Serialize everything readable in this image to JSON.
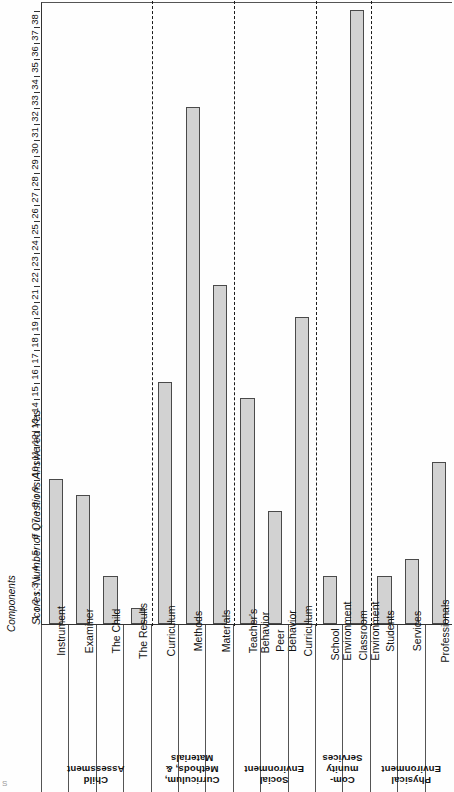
{
  "axis": {
    "title": "Scores: Number of Questions Answered Yes",
    "components_label": "Components",
    "tick_min": 1,
    "tick_max": 38,
    "ticks": [
      1,
      2,
      3,
      4,
      5,
      6,
      7,
      8,
      9,
      10,
      11,
      12,
      13,
      14,
      15,
      16,
      17,
      18,
      19,
      20,
      21,
      22,
      23,
      24,
      25,
      26,
      27,
      28,
      29,
      30,
      31,
      32,
      33,
      34,
      35,
      36,
      37,
      38
    ]
  },
  "corner_mark": "S",
  "colors": {
    "bar_fill": "#d2d2d2",
    "bar_stroke": "#4a4a4a",
    "axis": "#333333",
    "separator": "#1a1a1a"
  },
  "chart_data": {
    "type": "bar",
    "title": "",
    "xlabel": "Components",
    "ylabel": "Scores: Number of Questions Answered Yes",
    "ylim": [
      0,
      38
    ],
    "grid": false,
    "legend": "none",
    "orientation": "vertical-rotated",
    "categories": [
      "Instrument",
      "Examiner",
      "The Child",
      "The Results",
      "Curriculum",
      "Methods",
      "Materials",
      "Teacher's Behavior",
      "Peer Behavior",
      "Curriculum",
      "School Environment",
      "Classroom Environment",
      "Students",
      "Services",
      "Professionals"
    ],
    "values": [
      9,
      8,
      3,
      1,
      15,
      32,
      21,
      14,
      7,
      19,
      3,
      38,
      3,
      4,
      10
    ],
    "groups": [
      {
        "name": "Child Assessment",
        "lines": [
          "Child",
          "Assessment"
        ],
        "items": [
          {
            "label_lines": [
              "Instrument"
            ],
            "value": 9
          },
          {
            "label_lines": [
              "Examiner"
            ],
            "value": 8
          },
          {
            "label_lines": [
              "The Child"
            ],
            "value": 3
          },
          {
            "label_lines": [
              "The Results"
            ],
            "value": 1
          }
        ]
      },
      {
        "name": "Curriculum, Methods, & Materials",
        "lines": [
          "Curriculum,",
          "Methods, &",
          "Materials"
        ],
        "items": [
          {
            "label_lines": [
              "Curriculum"
            ],
            "value": 15
          },
          {
            "label_lines": [
              "Methods"
            ],
            "value": 32
          },
          {
            "label_lines": [
              "Materials"
            ],
            "value": 21
          }
        ]
      },
      {
        "name": "Social Environment",
        "lines": [
          "Social",
          "Environment"
        ],
        "items": [
          {
            "label_lines": [
              "Teacher's",
              "Behavior"
            ],
            "value": 14
          },
          {
            "label_lines": [
              "Peer",
              "Behavior"
            ],
            "value": 7
          },
          {
            "label_lines": [
              "Curriculum"
            ],
            "value": 19
          }
        ]
      },
      {
        "name": "Community Services",
        "lines": [
          "Com-",
          "munity",
          "Services"
        ],
        "items": [
          {
            "label_lines": [
              "School",
              "Environment"
            ],
            "value": 3
          },
          {
            "label_lines": [
              "Classroom",
              "Environment"
            ],
            "value": 38
          }
        ]
      },
      {
        "name": "Physical Environment",
        "lines": [
          "Physical",
          "Environment"
        ],
        "items": [
          {
            "label_lines": [
              "Students"
            ],
            "value": 3
          },
          {
            "label_lines": [
              "Services"
            ],
            "value": 4
          },
          {
            "label_lines": [
              "Professionals"
            ],
            "value": 10
          }
        ]
      }
    ]
  }
}
